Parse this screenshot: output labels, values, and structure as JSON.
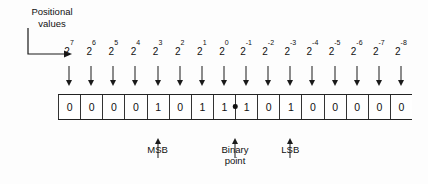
{
  "figure": {
    "callout": {
      "line1": "Positional",
      "line2": "values"
    },
    "positional_values": [
      "2⁷",
      "2⁶",
      "2⁵",
      "2⁴",
      "2³",
      "2²",
      "2¹",
      "2⁰",
      "2⁻¹",
      "2⁻²",
      "2⁻³",
      "2⁻⁴",
      "2⁻⁵",
      "2⁻⁶",
      "2⁻⁷",
      "2⁻⁸"
    ],
    "exponent_bases": [
      "2",
      "2",
      "2",
      "2",
      "2",
      "2",
      "2",
      "2",
      "2",
      "2",
      "2",
      "2",
      "2",
      "2",
      "2",
      "2"
    ],
    "exponent_superscripts": [
      "7",
      "6",
      "5",
      "4",
      "3",
      "2",
      "1",
      "0",
      "-1",
      "-2",
      "-3",
      "-4",
      "-5",
      "-6",
      "-7",
      "-8"
    ],
    "bits": [
      "0",
      "0",
      "0",
      "0",
      "1",
      "0",
      "1",
      "1",
      "1",
      "0",
      "1",
      "0",
      "0",
      "0",
      "0",
      "0"
    ],
    "bit_string": "00001011.10100000",
    "binary_point_after_index": 7,
    "markers": [
      {
        "name": "msb",
        "label_line1": "MSB",
        "label_line2": "",
        "column_index": 4
      },
      {
        "name": "binary-point",
        "label_line1": "Binary",
        "label_line2": "point",
        "column_index": 7.5
      },
      {
        "name": "lsb",
        "label_line1": "LSB",
        "label_line2": "",
        "column_index": 10
      }
    ],
    "colors": {
      "ink": "#111111",
      "rail": "#222222",
      "divider": "#333333",
      "background": "#fdfdfd"
    }
  }
}
